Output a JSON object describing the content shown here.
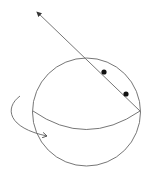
{
  "diagram": {
    "type": "sphere-with-axis-line",
    "colors": {
      "stroke": "#555555",
      "point": "#111111",
      "background": "#ffffff"
    },
    "sphere": {
      "cx": 86.5,
      "cy": 112,
      "r": 54
    },
    "equator": {
      "from": [
        33,
        111
      ],
      "control": [
        86,
        148
      ],
      "to": [
        140,
        111
      ]
    },
    "line": {
      "from": [
        140,
        111
      ],
      "to": [
        37,
        12
      ],
      "arrow_at": "end"
    },
    "points": [
      {
        "x": 104,
        "y": 72
      },
      {
        "x": 126,
        "y": 94
      }
    ],
    "rotation_arrow": {
      "path": "M20,96 C4,108 8,128 47,136",
      "arrow_at": "end"
    }
  }
}
